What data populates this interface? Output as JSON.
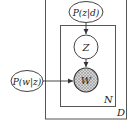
{
  "diagram": {
    "type": "plate-notation",
    "plates": {
      "outer": {
        "label": "D"
      },
      "inner": {
        "label": "N"
      }
    },
    "nodes": {
      "topic_given_doc": {
        "label": "P(z|d)",
        "shape": "ellipse",
        "observed": false
      },
      "word_given_topic": {
        "label": "P(w|z)",
        "shape": "ellipse",
        "observed": false
      },
      "z": {
        "label": "Z",
        "shape": "circle",
        "observed": false
      },
      "w": {
        "label": "W",
        "shape": "circle",
        "observed": true
      }
    },
    "edges": [
      {
        "from": "P(z|d)",
        "to": "Z"
      },
      {
        "from": "Z",
        "to": "W"
      },
      {
        "from": "P(w|z)",
        "to": "W"
      }
    ],
    "colors": {
      "stroke": "#444444",
      "shaded": "#bdbdbd",
      "background": "#ffffff"
    }
  }
}
